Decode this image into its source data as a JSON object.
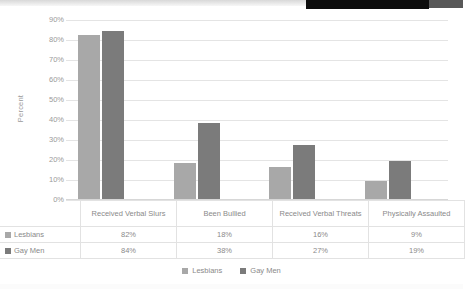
{
  "chart_data": {
    "type": "bar",
    "title": "",
    "xlabel": "",
    "ylabel": "Percent",
    "ylim": [
      0,
      90
    ],
    "grid": true,
    "legend_position": "bottom",
    "categories": [
      "Received Verbal Slurs",
      "Been Bullied",
      "Received Verbal Threats",
      "Physically Assaulted"
    ],
    "series": [
      {
        "name": "Lesbians",
        "color": "#a8a8a8",
        "values": [
          82,
          18,
          16,
          9
        ],
        "labels": [
          "82%",
          "18%",
          "16%",
          "9%"
        ]
      },
      {
        "name": "Gay Men",
        "color": "#7b7b7b",
        "values": [
          84,
          38,
          27,
          19
        ],
        "labels": [
          "84%",
          "38%",
          "27%",
          "19%"
        ]
      }
    ],
    "yticks": [
      "0%",
      "10%",
      "20%",
      "30%",
      "40%",
      "50%",
      "60%",
      "70%",
      "80%",
      "90%"
    ],
    "ytick_values": [
      0,
      10,
      20,
      30,
      40,
      50,
      60,
      70,
      80,
      90
    ]
  },
  "axis": {
    "y_title": "Percent"
  },
  "table": {
    "category_labels": [
      "Received Verbal Slurs",
      "Been Bullied",
      "Received Verbal Threats",
      "Physically Assaulted"
    ],
    "rows": [
      {
        "label": "Lesbians",
        "values": [
          "82%",
          "18%",
          "16%",
          "9%"
        ]
      },
      {
        "label": "Gay Men",
        "values": [
          "84%",
          "38%",
          "27%",
          "19%"
        ]
      }
    ]
  },
  "legend": {
    "items": [
      {
        "label": "Lesbians",
        "color": "#a8a8a8"
      },
      {
        "label": "Gay Men",
        "color": "#7b7b7b"
      }
    ]
  },
  "colors": {
    "series_1": "#a8a8a8",
    "series_2": "#7b7b7b",
    "gridline": "#e4e4e4",
    "text": "#8a8a8a"
  }
}
